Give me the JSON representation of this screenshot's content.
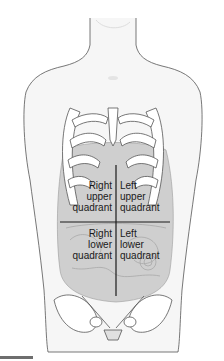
{
  "diagram": {
    "quadrants": [
      {
        "id": "ruq",
        "lines": [
          "Right",
          "upper",
          "quadrant"
        ]
      },
      {
        "id": "luq",
        "lines": [
          "Left",
          "upper",
          "quadrant"
        ]
      },
      {
        "id": "rlq",
        "lines": [
          "Right",
          "lower",
          "quadrant"
        ]
      },
      {
        "id": "llq",
        "lines": [
          "Left",
          "lower",
          "quadrant"
        ]
      }
    ],
    "colors": {
      "outline": "#4a4a4a",
      "skin": "#f4f4f4",
      "organs": "#c8c8c8",
      "bone": "#ffffff",
      "divider": "#1a1a1a",
      "footer_bar": "#6e6e6e"
    }
  }
}
